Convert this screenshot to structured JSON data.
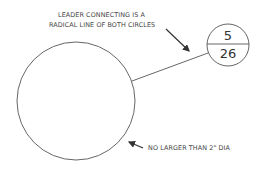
{
  "diagram": {
    "annotation_top": {
      "line1": "LEADER CONNECTING IS A",
      "line2": "RADICAL LINE OF BOTH CIRCLES"
    },
    "annotation_bottom": "NO LARGER THAN 2\" DIA",
    "bubble": {
      "top_value": "5",
      "bottom_value": "26"
    },
    "colors": {
      "stroke": "#444444",
      "background": "#ffffff"
    }
  }
}
